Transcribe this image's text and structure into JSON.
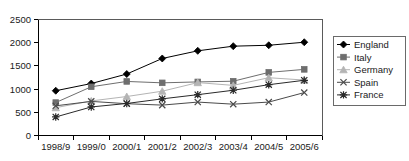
{
  "chart_data": {
    "type": "line",
    "title": "",
    "xlabel": "",
    "ylabel": "",
    "ylim": [
      0,
      2500
    ],
    "yticks": [
      0,
      500,
      1000,
      1500,
      2000,
      2500
    ],
    "grid": false,
    "legend_position": "right",
    "categories": [
      "1998/9",
      "1999/0",
      "2000/1",
      "2001/2",
      "2002/3",
      "2003/4",
      "2004/5",
      "2005/6"
    ],
    "series": [
      {
        "name": "England",
        "marker": "diamond",
        "color": "#000000",
        "values": [
          965,
          1120,
          1325,
          1660,
          1825,
          1925,
          1945,
          2010
        ]
      },
      {
        "name": "Italy",
        "marker": "square",
        "color": "#6e6e6e",
        "values": [
          710,
          1050,
          1165,
          1135,
          1155,
          1170,
          1360,
          1425
        ]
      },
      {
        "name": "Germany",
        "marker": "triangle",
        "color": "#b4b4b4",
        "values": [
          600,
          745,
          840,
          955,
          1140,
          1080,
          1245,
          1195
        ]
      },
      {
        "name": "Spain",
        "marker": "cross",
        "color": "#4a4a4a",
        "values": [
          640,
          735,
          685,
          655,
          720,
          675,
          720,
          925
        ]
      },
      {
        "name": "France",
        "marker": "asterisk",
        "color": "#2a2a2a",
        "values": [
          400,
          615,
          690,
          790,
          880,
          975,
          1095,
          1190
        ]
      }
    ]
  },
  "legend": {
    "entries": [
      {
        "label": "England"
      },
      {
        "label": "Italy"
      },
      {
        "label": "Germany"
      },
      {
        "label": "Spain"
      },
      {
        "label": "France"
      }
    ]
  },
  "axes": {
    "y_tick_labels": [
      "2500",
      "2000",
      "1500",
      "1000",
      "500",
      "0"
    ],
    "x_tick_labels": [
      "1998/9",
      "1999/0",
      "2000/1",
      "2001/2",
      "2002/3",
      "2003/4",
      "2004/5",
      "2005/6"
    ]
  }
}
